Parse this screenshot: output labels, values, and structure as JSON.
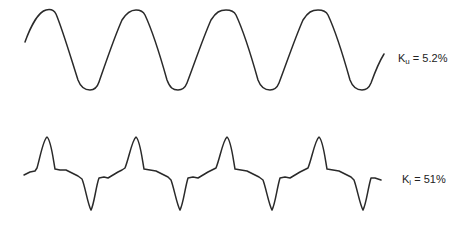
{
  "figure": {
    "waveforms": [
      {
        "id": "voltage",
        "description": "near-sinusoidal waveform",
        "label": {
          "symbol": "K",
          "subscript": "u",
          "equals": " = ",
          "value": "5.2%"
        },
        "periods_shown": 4,
        "peaks_x": [
          48,
          136,
          228,
          320
        ],
        "troughs_x": [
          90,
          177,
          270,
          362
        ]
      },
      {
        "id": "current",
        "description": "distorted pulsed waveform with sharp peaks and troughs",
        "label": {
          "symbol": "K",
          "subscript": "i",
          "equals": " = ",
          "value": "51%"
        },
        "periods_shown": 4,
        "peaks_x": [
          47,
          136,
          227,
          319
        ],
        "troughs_x": [
          91,
          180,
          272,
          363
        ]
      }
    ],
    "stroke_color": "#2a2a2a",
    "background": "#ffffff"
  }
}
